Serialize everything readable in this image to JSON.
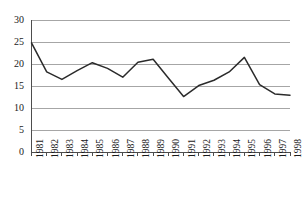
{
  "chart_data": {
    "type": "line",
    "title": "",
    "subtitle": "",
    "xlabel": "",
    "ylabel": "",
    "categories": [
      "1981",
      "1982",
      "1983",
      "1984",
      "1985",
      "1986",
      "1987",
      "1988",
      "1989",
      "1990",
      "1991",
      "1992",
      "1993",
      "1994",
      "1995",
      "1996",
      "1997",
      "1998"
    ],
    "values": [
      24.8,
      18.2,
      16.5,
      18.5,
      20.3,
      19.0,
      17.0,
      20.4,
      21.1,
      16.8,
      12.6,
      15.1,
      16.3,
      18.2,
      21.5,
      15.3,
      13.2,
      12.9
    ],
    "series": [
      {
        "name": "series-1",
        "values": [
          24.8,
          18.2,
          16.5,
          18.5,
          20.3,
          19.0,
          17.0,
          20.4,
          21.1,
          16.8,
          12.6,
          15.1,
          16.3,
          18.2,
          21.5,
          15.3,
          13.2,
          12.9
        ]
      }
    ],
    "ylim": [
      0,
      30
    ],
    "yticks": [
      0,
      5,
      10,
      15,
      20,
      25,
      30
    ],
    "ytick_labels": [
      "0",
      "5",
      "10",
      "15",
      "20",
      "25",
      "30"
    ],
    "xtick_labels": [
      "1981",
      "1982",
      "1983",
      "1984",
      "1985",
      "1986",
      "1987",
      "1988",
      "1989",
      "1990",
      "1991",
      "1992",
      "1993",
      "1994",
      "1995",
      "1996",
      "1997",
      "1998"
    ],
    "grid": true,
    "grid_axis": "y",
    "legend": false,
    "legend_position": "none",
    "annotations": []
  },
  "style": {
    "line_color": "#2b2b2b",
    "grid_color": "#a6a6a6",
    "axis_color": "#4d4d4d",
    "text_color": "#1a1a1a",
    "background": "#ffffff"
  }
}
